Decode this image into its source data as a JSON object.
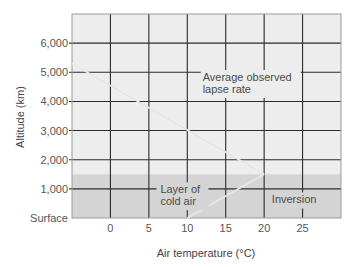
{
  "chart_data": {
    "type": "line",
    "title": "",
    "xlabel": "Air temperature (°C)",
    "ylabel": "Altitude (km)",
    "xlim": [
      -5,
      30
    ],
    "ylim": [
      0,
      7000
    ],
    "x_ticks": [
      0,
      5,
      10,
      15,
      20,
      25
    ],
    "x_tick_labels": [
      "0",
      "5",
      "10",
      "15",
      "20",
      "25"
    ],
    "y_ticks": [
      0,
      1000,
      2000,
      3000,
      4000,
      5000,
      6000
    ],
    "y_tick_labels": [
      "Surface",
      "1,000",
      "2,000",
      "3,000",
      "4,000",
      "5,000",
      "6,000"
    ],
    "grid": true,
    "legend": null,
    "series": [
      {
        "name": "Average observed lapse rate",
        "points": [
          [
            -5,
            5300
          ],
          [
            20,
            1500
          ]
        ]
      },
      {
        "name": "Inversion",
        "points": [
          [
            20,
            1500
          ],
          [
            10,
            0
          ]
        ]
      }
    ],
    "shaded_regions": [
      {
        "name": "Layer of cold air",
        "y_range": [
          0,
          1500
        ],
        "color": "#d4d4d4"
      }
    ],
    "annotations": [
      {
        "text": [
          "Average observed",
          "lapse rate"
        ],
        "x": 12,
        "y": 4700
      },
      {
        "text": [
          "Layer of",
          "cold air"
        ],
        "x": 6.5,
        "y": 850
      },
      {
        "text": [
          "Inversion"
        ],
        "x": 21,
        "y": 500
      }
    ],
    "colors": {
      "plot_background": "#ededed",
      "cold_layer": "#d4d4d4",
      "grid": "#2b2b2b",
      "line": "#e6e6e6"
    }
  }
}
